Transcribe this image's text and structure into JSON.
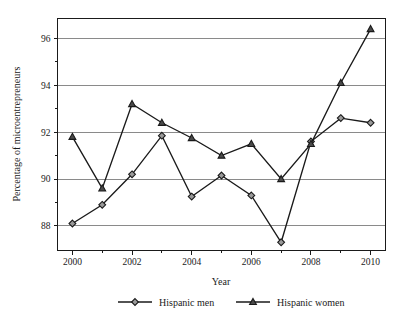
{
  "chart_data": {
    "type": "line",
    "title": "",
    "xlabel": "Year",
    "ylabel": "Percentage of microentrepreneurs",
    "x": [
      2000,
      2001,
      2002,
      2003,
      2004,
      2005,
      2006,
      2007,
      2008,
      2009,
      2010
    ],
    "xtick_labels": [
      "2000",
      "2002",
      "2004",
      "2006",
      "2008",
      "2010"
    ],
    "xtick_values": [
      2000,
      2002,
      2004,
      2006,
      2008,
      2010
    ],
    "xminor_values": [
      2001,
      2003,
      2005,
      2007,
      2009
    ],
    "xlim": [
      1999.5,
      2010.5
    ],
    "ytick_labels": [
      "88",
      "90",
      "92",
      "94",
      "96"
    ],
    "ytick_values": [
      88,
      90,
      92,
      94,
      96
    ],
    "yminor_values": [
      89,
      91,
      93,
      95
    ],
    "ylim": [
      86.95,
      96.85
    ],
    "grid": "horizontal-major",
    "legend_position": "bottom-outside",
    "series": [
      {
        "name": "Hispanic men",
        "marker": "diamond",
        "marker_fill": "#9a9a9a",
        "line_color": "#1a1a1a",
        "values": [
          88.1,
          88.9,
          90.2,
          91.85,
          89.25,
          90.15,
          89.3,
          87.3,
          91.6,
          92.6,
          92.4
        ]
      },
      {
        "name": "Hispanic women",
        "marker": "triangle",
        "marker_fill": "#4a4a4a",
        "line_color": "#1a1a1a",
        "values": [
          91.8,
          89.6,
          93.2,
          92.4,
          91.75,
          91.0,
          91.5,
          90.0,
          91.5,
          94.1,
          96.4
        ]
      }
    ]
  },
  "legend": {
    "entries": [
      {
        "label": "Hispanic men"
      },
      {
        "label": "Hispanic women"
      }
    ]
  },
  "axes": {
    "x_title": "Year",
    "y_title": "Percentage of microentrepreneurs"
  }
}
